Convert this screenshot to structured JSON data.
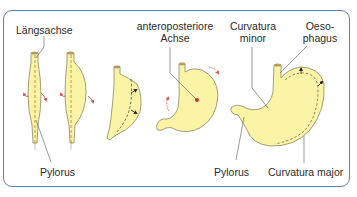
{
  "diagram": {
    "type": "stomach-rotation-sequence",
    "colors": {
      "frame": "#5b7fb4",
      "stomach_fill": "#fbf3a6",
      "stomach_outline": "#8c8a62",
      "axis_dash": "#c98a3a",
      "rotation_arrow": "#d9534f",
      "label_line": "#555555",
      "esophagus_top": "#b39a62"
    },
    "labels": {
      "laengsachse": "Längsachse",
      "pylorus_left": "Pylorus",
      "ap_axis_line1": "anteroposteriore",
      "ap_axis_line2": "Achse",
      "curvatura_minor_line1": "Curvatura",
      "curvatura_minor_line2": "minor",
      "oesophagus_line1": "Oeso-",
      "oesophagus_line2": "phagus",
      "pylorus_right": "Pylorus",
      "curvatura_major": "Curvatura major"
    },
    "stages": [
      {
        "index": 1,
        "description": "tube with longitudinal axis, rotation arrows"
      },
      {
        "index": 2,
        "description": "dorsal wall bulging, rotation arrows"
      },
      {
        "index": 3,
        "description": "rotation around longitudinal axis with dashed line and arrows"
      },
      {
        "index": 4,
        "description": "rotation around anteroposterior axis"
      },
      {
        "index": 5,
        "description": "final stomach with curvatures labeled"
      }
    ]
  }
}
